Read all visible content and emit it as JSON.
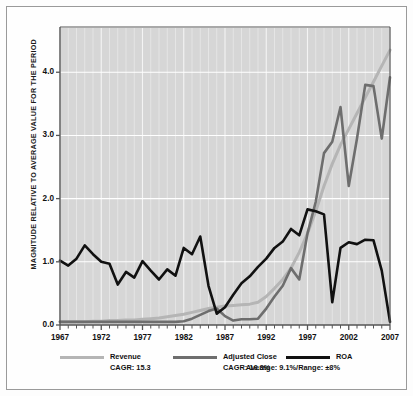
{
  "chart_data": {
    "type": "line",
    "title": "",
    "xlabel": "",
    "ylabel": "MAGNITUDE RELATIVE TO AVERAGE VALUE FOR THE PERIOD",
    "xlim": [
      1967,
      2007
    ],
    "ylim": [
      0.0,
      4.7
    ],
    "grid": true,
    "legend_position": "bottom",
    "y_ticks": [
      "0.0",
      "1.0",
      "2.0",
      "3.0",
      "4.0"
    ],
    "y_tick_values": [
      0.0,
      1.0,
      2.0,
      3.0,
      4.0
    ],
    "x_ticks": [
      "1967",
      "1972",
      "1977",
      "1982",
      "1987",
      "1992",
      "1997",
      "2002",
      "2007"
    ],
    "x_tick_values": [
      1967,
      1972,
      1977,
      1982,
      1987,
      1992,
      1997,
      2002,
      2007
    ],
    "x": [
      1967,
      1968,
      1969,
      1970,
      1971,
      1972,
      1973,
      1974,
      1975,
      1976,
      1977,
      1978,
      1979,
      1980,
      1981,
      1982,
      1983,
      1984,
      1985,
      1986,
      1987,
      1988,
      1989,
      1990,
      1991,
      1992,
      1993,
      1994,
      1995,
      1996,
      1997,
      1998,
      1999,
      2000,
      2001,
      2002,
      2003,
      2004,
      2005,
      2006,
      2007
    ],
    "series": [
      {
        "name": "Revenue",
        "color": "#b5b5b5",
        "sublabel": "CAGR: 15.3",
        "values": [
          0.05,
          0.05,
          0.05,
          0.05,
          0.06,
          0.06,
          0.07,
          0.07,
          0.08,
          0.08,
          0.09,
          0.1,
          0.11,
          0.13,
          0.15,
          0.17,
          0.2,
          0.23,
          0.26,
          0.28,
          0.3,
          0.31,
          0.32,
          0.33,
          0.36,
          0.45,
          0.58,
          0.72,
          0.9,
          1.15,
          1.45,
          1.8,
          2.2,
          2.55,
          2.85,
          3.1,
          3.35,
          3.6,
          3.85,
          4.1,
          4.35
        ]
      },
      {
        "name": "Adjusted Close",
        "color": "#6e6e6e",
        "sublabel": "CAGR: 16.3%",
        "values": [
          0.05,
          0.05,
          0.05,
          0.05,
          0.05,
          0.05,
          0.05,
          0.05,
          0.05,
          0.05,
          0.05,
          0.05,
          0.05,
          0.05,
          0.05,
          0.06,
          0.1,
          0.16,
          0.22,
          0.26,
          0.14,
          0.07,
          0.09,
          0.09,
          0.1,
          0.26,
          0.45,
          0.62,
          0.9,
          0.72,
          1.45,
          1.95,
          2.72,
          2.9,
          3.45,
          2.2,
          2.95,
          3.8,
          3.78,
          2.95,
          3.92
        ]
      },
      {
        "name": "ROA",
        "color": "#111111",
        "sublabel": "Average: 9.1%/Range: ±8%",
        "values": [
          1.02,
          0.94,
          1.05,
          1.26,
          1.12,
          1.0,
          0.97,
          0.64,
          0.84,
          0.75,
          1.01,
          0.86,
          0.72,
          0.88,
          0.78,
          1.22,
          1.12,
          1.4,
          0.62,
          0.18,
          0.28,
          0.48,
          0.66,
          0.77,
          0.92,
          1.05,
          1.22,
          1.32,
          1.52,
          1.42,
          1.83,
          1.8,
          1.75,
          0.36,
          1.22,
          1.31,
          1.28,
          1.35,
          1.34,
          0.86,
          0.05
        ]
      }
    ]
  },
  "legend": {
    "items": [
      {
        "label": "Revenue",
        "sublabel": "CAGR: 15.3",
        "color": "#b5b5b5"
      },
      {
        "label": "Adjusted Close",
        "sublabel": "CAGR: 16.3%",
        "color": "#6e6e6e"
      },
      {
        "label": "ROA",
        "sublabel": "Average: 9.1%/Range: ±8%",
        "color": "#111111"
      }
    ]
  },
  "colors": {
    "plot_background": "#d6d6d6",
    "gridline": "#f4f4f4",
    "axis": "#555555",
    "frame": "#9a9a9a",
    "page_background": "#fdfdfd"
  }
}
